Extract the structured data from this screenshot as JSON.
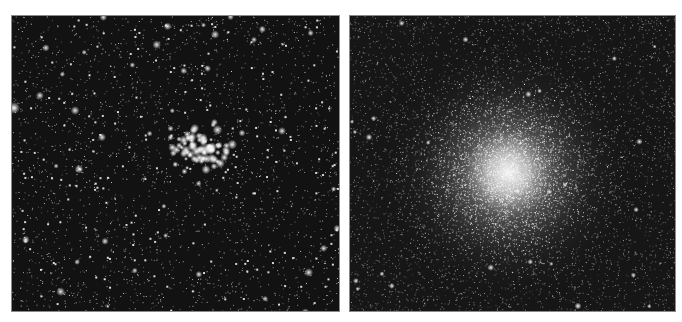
{
  "figure": {
    "panels": [
      {
        "id": "left",
        "subject": "open star cluster in dense star field",
        "background_color": "#121212"
      },
      {
        "id": "right",
        "subject": "globular star cluster with bright diffuse core",
        "background_color": "#151515"
      }
    ]
  }
}
